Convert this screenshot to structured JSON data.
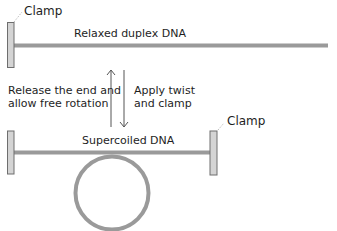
{
  "diagram": {
    "top_clamp_label": "Clamp",
    "relaxed_label": "Relaxed duplex DNA",
    "left_arrow_label_line1": "Release the end and",
    "left_arrow_label_line2": "allow free rotation",
    "right_arrow_label_line1": "Apply twist",
    "right_arrow_label_line2": "and clamp",
    "supercoiled_label": "Supercoiled DNA",
    "right_clamp_label": "Clamp",
    "colors": {
      "dna": "#9a9a9a",
      "clamp_fill": "#d4d4d4",
      "clamp_stroke": "#6e6e6e",
      "arrow": "#555555",
      "text": "#1e1e1e"
    }
  }
}
